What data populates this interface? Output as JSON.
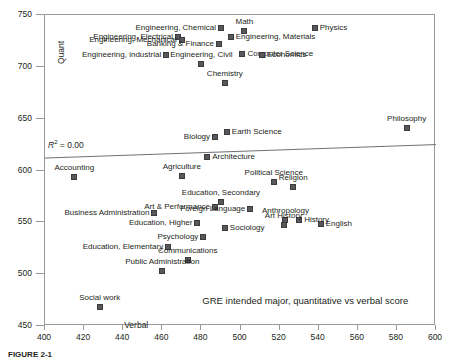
{
  "figure": {
    "caption": "FIGURE 2-1"
  },
  "chart_data": {
    "type": "scatter",
    "title": "GRE intended major, quantitative vs verbal score",
    "xlabel": "Verbal",
    "ylabel": "Quant",
    "xlim": [
      400,
      600
    ],
    "ylim": [
      450,
      750
    ],
    "xticks": [
      400,
      420,
      440,
      460,
      480,
      500,
      520,
      540,
      560,
      580,
      600
    ],
    "yticks": [
      450,
      500,
      550,
      600,
      650,
      700,
      750
    ],
    "grid": false,
    "legend": null,
    "annotations": [
      {
        "text": "R2 = 0.00",
        "x": 409,
        "y": 619
      }
    ],
    "trendline": {
      "label": "R² = 0.00",
      "r2": 0.0,
      "x": [
        400,
        600
      ],
      "y": [
        612,
        625
      ]
    },
    "points": [
      {
        "label": "Math",
        "x": 502,
        "y": 735,
        "lpos": "c"
      },
      {
        "label": "Physics",
        "x": 538,
        "y": 737,
        "lpos": "r"
      },
      {
        "label": "Engineering, Chemical",
        "x": 490,
        "y": 737,
        "lpos": "l"
      },
      {
        "label": "Engineering, Materials",
        "x": 495,
        "y": 729,
        "lpos": "r"
      },
      {
        "label": "Engineering, Electrical",
        "x": 468,
        "y": 729,
        "lpos": "l"
      },
      {
        "label": "Engineering, Mechanical",
        "x": 470,
        "y": 726,
        "lpos": "l"
      },
      {
        "label": "Banking & Finance",
        "x": 489,
        "y": 722,
        "lpos": "l"
      },
      {
        "label": "Engineering, industrial",
        "x": 462,
        "y": 711,
        "lpos": "l"
      },
      {
        "label": "Computer Science",
        "x": 501,
        "y": 712,
        "lpos": "r"
      },
      {
        "label": "Economics",
        "x": 511,
        "y": 711,
        "lpos": "r"
      },
      {
        "label": "Engineering, Civil",
        "x": 480,
        "y": 703,
        "lpos": "c"
      },
      {
        "label": "Chemistry",
        "x": 492,
        "y": 684,
        "lpos": "c"
      },
      {
        "label": "Earth Science",
        "x": 493,
        "y": 637,
        "lpos": "r"
      },
      {
        "label": "Biology",
        "x": 487,
        "y": 632,
        "lpos": "l"
      },
      {
        "label": "Philosophy",
        "x": 585,
        "y": 641,
        "lpos": "c"
      },
      {
        "label": "Architecture",
        "x": 483,
        "y": 613,
        "lpos": "r"
      },
      {
        "label": "Accounting",
        "x": 415,
        "y": 594,
        "lpos": "c"
      },
      {
        "label": "Agriculture",
        "x": 470,
        "y": 595,
        "lpos": "c"
      },
      {
        "label": "Political Science",
        "x": 517,
        "y": 589,
        "lpos": "c"
      },
      {
        "label": "Religion",
        "x": 527,
        "y": 584,
        "lpos": "c"
      },
      {
        "label": "Education, Secondary",
        "x": 490,
        "y": 570,
        "lpos": "c"
      },
      {
        "label": "Art & Performance",
        "x": 487,
        "y": 565,
        "lpos": "l"
      },
      {
        "label": "Foreign Language",
        "x": 505,
        "y": 563,
        "lpos": "l"
      },
      {
        "label": "Business Administration",
        "x": 456,
        "y": 559,
        "lpos": "l"
      },
      {
        "label": "Anthropology",
        "x": 523,
        "y": 552,
        "lpos": "c"
      },
      {
        "label": "History",
        "x": 530,
        "y": 552,
        "lpos": "r"
      },
      {
        "label": "English",
        "x": 541,
        "y": 548,
        "lpos": "r"
      },
      {
        "label": "Education, Higher",
        "x": 478,
        "y": 549,
        "lpos": "l"
      },
      {
        "label": "Sociology",
        "x": 492,
        "y": 545,
        "lpos": "r"
      },
      {
        "label": "Art History",
        "x": 522,
        "y": 547,
        "lpos": "c"
      },
      {
        "label": "Psychology",
        "x": 481,
        "y": 536,
        "lpos": "l"
      },
      {
        "label": "Education, Elementary",
        "x": 463,
        "y": 526,
        "lpos": "l"
      },
      {
        "label": "Communications",
        "x": 473,
        "y": 514,
        "lpos": "c"
      },
      {
        "label": "Public Administration",
        "x": 460,
        "y": 503,
        "lpos": "c"
      },
      {
        "label": "Social work",
        "x": 428,
        "y": 468,
        "lpos": "c"
      }
    ]
  }
}
